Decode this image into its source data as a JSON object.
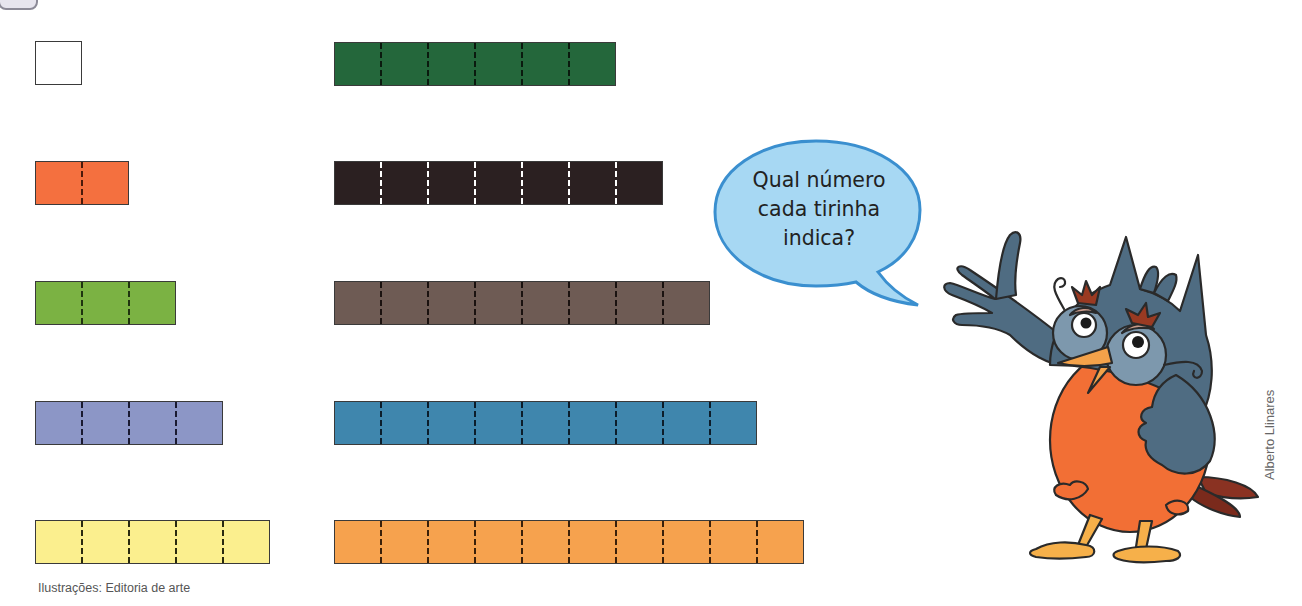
{
  "header": {
    "badge_visible": true
  },
  "strips": {
    "left_column": [
      {
        "id": "strip-1",
        "units": 1,
        "color": "#ffffff",
        "divider_color": "#1a1a1a",
        "x": 35,
        "y": 41
      },
      {
        "id": "strip-2",
        "units": 2,
        "color": "#f4703f",
        "divider_color": "#4a1a0a",
        "x": 35,
        "y": 161
      },
      {
        "id": "strip-3",
        "units": 3,
        "color": "#7bb243",
        "divider_color": "#1f3310",
        "x": 35,
        "y": 281
      },
      {
        "id": "strip-4",
        "units": 4,
        "color": "#8c96c6",
        "divider_color": "#1a1a30",
        "x": 35,
        "y": 401
      },
      {
        "id": "strip-5",
        "units": 5,
        "color": "#fbef8e",
        "divider_color": "#2a2a10",
        "x": 35,
        "y": 520
      }
    ],
    "right_column": [
      {
        "id": "strip-6",
        "units": 6,
        "color": "#24673b",
        "divider_color": "#0a1a0e",
        "x": 334,
        "y": 42
      },
      {
        "id": "strip-7",
        "units": 7,
        "color": "#2b2021",
        "divider_color": "#ffffff",
        "x": 334,
        "y": 161
      },
      {
        "id": "strip-8",
        "units": 8,
        "color": "#6e5b54",
        "divider_color": "#1a1210",
        "x": 334,
        "y": 281
      },
      {
        "id": "strip-9",
        "units": 9,
        "color": "#3f86ad",
        "divider_color": "#0d1d2a",
        "x": 334,
        "y": 401
      },
      {
        "id": "strip-10",
        "units": 10,
        "color": "#f6a24e",
        "divider_color": "#3a200a",
        "x": 334,
        "y": 520
      }
    ],
    "unit_width": 47,
    "height": 44
  },
  "speech_bubble": {
    "lines": [
      "Qual número",
      "cada tirinha",
      "indica?"
    ],
    "fill": "#a7d8f3",
    "stroke": "#3a8fcf"
  },
  "character": {
    "name": "owl-character",
    "body_color": "#f26f35",
    "wing_color": "#4f6c82"
  },
  "credits": {
    "illustrations": "Ilustrações: Editoria de arte",
    "artist": "Alberto Llinares"
  }
}
